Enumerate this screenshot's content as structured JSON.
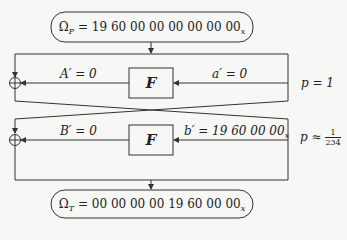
{
  "plaintext_box": {
    "symbol": "Ω",
    "subscript": "P",
    "value": "= 19 60 00 00  00 00 00 00",
    "suffix": "x"
  },
  "ciphertext_box": {
    "symbol": "Ω",
    "subscript": "T",
    "value": "= 00 00 00 00  19 60 00 00",
    "suffix": "x"
  },
  "round1": {
    "function_label": "F",
    "input_label": "a′ = 0",
    "output_label": "A′ = 0",
    "probability": "p = 1"
  },
  "round2": {
    "function_label": "F",
    "input_label_prefix": "b′ = 19 60 00 00",
    "input_label_suffix": "x",
    "output_label": "B′ = 0",
    "probability_prefix": "p ≈",
    "probability_num": "1",
    "probability_den": "234"
  },
  "colors": {
    "stroke": "#333333",
    "background": "#f7f7f5"
  }
}
